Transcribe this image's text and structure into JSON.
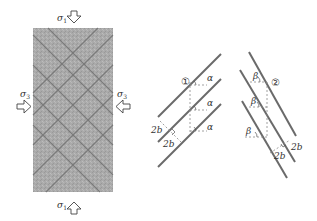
{
  "specimen": {
    "top_label": "σ1",
    "bottom_label": "σ1",
    "left_label": "σ3",
    "right_label": "σ3",
    "sigma_symbol": "σ",
    "sigma1_sub": "1",
    "sigma3_sub": "3",
    "fill_color": "#a9a9a9",
    "crack_color": "#6f6f6f"
  },
  "panel1": {
    "marker": "①",
    "angle_label": "α",
    "spacing_labels": [
      "2b",
      "2b"
    ]
  },
  "panel2": {
    "marker": "②",
    "angle_label": "β",
    "spacing_labels": [
      "2b",
      "2b"
    ]
  },
  "colors": {
    "line": "#6a6a6a",
    "dash": "#888888",
    "text": "#333333"
  }
}
